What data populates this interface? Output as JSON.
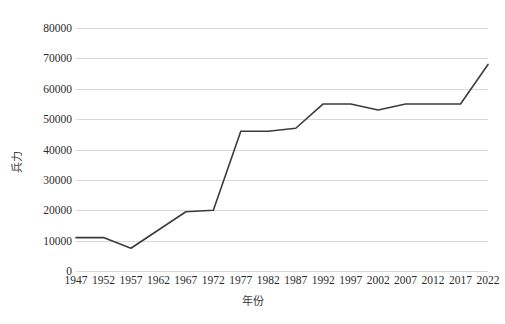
{
  "chart_data": {
    "type": "line",
    "title": "",
    "xlabel": "年份",
    "ylabel": "兵力",
    "categories": [
      "1947",
      "1952",
      "1957",
      "1962",
      "1967",
      "1972",
      "1977",
      "1982",
      "1987",
      "1992",
      "1997",
      "2002",
      "2007",
      "2012",
      "2017",
      "2022"
    ],
    "values": [
      11000,
      11000,
      7500,
      13500,
      19500,
      20000,
      46000,
      46000,
      47000,
      55000,
      55000,
      53000,
      55000,
      55000,
      55000,
      68000
    ],
    "series": [
      {
        "name": "兵力",
        "color": "#3b3b3b",
        "values": [
          11000,
          11000,
          7500,
          13500,
          19500,
          20000,
          46000,
          46000,
          47000,
          55000,
          55000,
          53000,
          55000,
          55000,
          55000,
          68000
        ]
      }
    ],
    "ylim": [
      0,
      80000
    ],
    "ytick_values": [
      0,
      10000,
      20000,
      30000,
      40000,
      50000,
      60000,
      70000,
      80000
    ],
    "ytick_labels": [
      "0",
      "10000",
      "20000",
      "30000",
      "40000",
      "50000",
      "60000",
      "70000",
      "80000"
    ],
    "grid": "horizontal",
    "legend": "none",
    "markers": "none",
    "background_color": "#ffffff",
    "gridline_color": "#d9d9d9",
    "line_color": "#3b3b3b",
    "line_width": 1.6
  }
}
